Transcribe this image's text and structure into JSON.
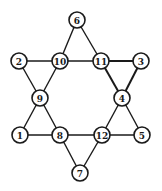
{
  "diagram": {
    "type": "hexagram-graph",
    "node_radius": 8,
    "nodes": [
      {
        "id": "6",
        "label": "6",
        "x": 77,
        "y": 20
      },
      {
        "id": "2",
        "label": "2",
        "x": 19,
        "y": 61
      },
      {
        "id": "10",
        "label": "10",
        "x": 60,
        "y": 61
      },
      {
        "id": "11",
        "label": "11",
        "x": 101,
        "y": 61
      },
      {
        "id": "3",
        "label": "3",
        "x": 141,
        "y": 61
      },
      {
        "id": "9",
        "label": "9",
        "x": 40,
        "y": 98
      },
      {
        "id": "4",
        "label": "4",
        "x": 122,
        "y": 98
      },
      {
        "id": "1",
        "label": "1",
        "x": 20,
        "y": 135
      },
      {
        "id": "8",
        "label": "8",
        "x": 60,
        "y": 135
      },
      {
        "id": "12",
        "label": "12",
        "x": 102,
        "y": 135
      },
      {
        "id": "5",
        "label": "5",
        "x": 142,
        "y": 135
      },
      {
        "id": "7",
        "label": "7",
        "x": 80,
        "y": 173
      }
    ],
    "edges": [
      [
        "6",
        "10"
      ],
      [
        "6",
        "11"
      ],
      [
        "2",
        "10"
      ],
      [
        "10",
        "11"
      ],
      [
        "11",
        "3"
      ],
      [
        "2",
        "9"
      ],
      [
        "10",
        "9"
      ],
      [
        "11",
        "4"
      ],
      [
        "3",
        "4"
      ],
      [
        "9",
        "1"
      ],
      [
        "9",
        "8"
      ],
      [
        "4",
        "12"
      ],
      [
        "4",
        "5"
      ],
      [
        "1",
        "8"
      ],
      [
        "8",
        "12"
      ],
      [
        "12",
        "5"
      ],
      [
        "8",
        "7"
      ],
      [
        "12",
        "7"
      ]
    ],
    "thick_edges": [
      [
        "11",
        "4"
      ],
      [
        "11",
        "3"
      ],
      [
        "3",
        "4"
      ]
    ]
  }
}
